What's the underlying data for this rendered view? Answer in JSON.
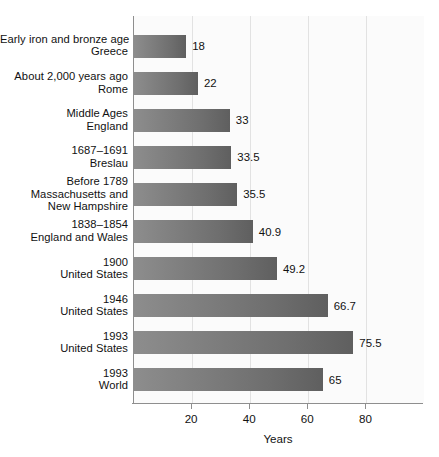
{
  "chart_data": {
    "type": "bar",
    "orientation": "horizontal",
    "title": "",
    "xlabel": "Years",
    "ylabel": "",
    "xlim": [
      0,
      100
    ],
    "grid": true,
    "legend": false,
    "xticks": [
      20,
      40,
      60,
      80
    ],
    "xtick_labels": [
      "20",
      "40",
      "60",
      "80"
    ],
    "categories": [
      "Early iron and bronze age Greece",
      "About 2,000 years ago Rome",
      "Middle Ages England",
      "1687–1691 Breslau",
      "Before 1789 Massachusetts and New Hampshire",
      "1838–1854 England and Wales",
      "1900 United States",
      "1946 United States",
      "1993 United States",
      "1993 World"
    ],
    "values": [
      18,
      22,
      33,
      33.5,
      35.5,
      40.9,
      49.2,
      66.7,
      75.5,
      65
    ],
    "value_labels": [
      "18",
      "22",
      "33",
      "33.5",
      "35.5",
      "40.9",
      "49.2",
      "66.7",
      "75.5",
      "65"
    ],
    "bars": [
      {
        "label_lines": [
          "Early iron and bronze age",
          "Greece"
        ],
        "value": 18,
        "value_label": "18"
      },
      {
        "label_lines": [
          "About 2,000 years ago",
          "Rome"
        ],
        "value": 22,
        "value_label": "22"
      },
      {
        "label_lines": [
          "Middle Ages",
          "England"
        ],
        "value": 33,
        "value_label": "33"
      },
      {
        "label_lines": [
          "1687–1691",
          "Breslau"
        ],
        "value": 33.5,
        "value_label": "33.5"
      },
      {
        "label_lines": [
          "Before 1789",
          "Massachusetts and",
          "New Hampshire"
        ],
        "value": 35.5,
        "value_label": "35.5"
      },
      {
        "label_lines": [
          "1838–1854",
          "England and Wales"
        ],
        "value": 40.9,
        "value_label": "40.9"
      },
      {
        "label_lines": [
          "1900",
          "United States"
        ],
        "value": 49.2,
        "value_label": "49.2"
      },
      {
        "label_lines": [
          "1946",
          "United States"
        ],
        "value": 66.7,
        "value_label": "66.7"
      },
      {
        "label_lines": [
          "1993",
          "United States"
        ],
        "value": 75.5,
        "value_label": "75.5"
      },
      {
        "label_lines": [
          "1993",
          "World"
        ],
        "value": 65,
        "value_label": "65"
      }
    ],
    "colors": {
      "bar_gradient_start": "#8d8d8d",
      "bar_gradient_end": "#5f5f5f",
      "plot_background": "#fbfbfb",
      "gridline": "#e2e2e2",
      "axis": "#8e8e8e",
      "text": "#111111"
    }
  }
}
